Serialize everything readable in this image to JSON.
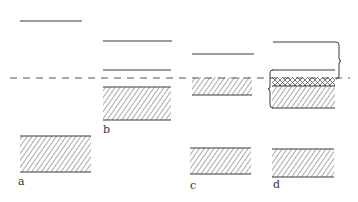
{
  "figure": {
    "stroke_color": "#3a3a3a",
    "hatch_color": "#555555",
    "reference_line": {
      "y": 78,
      "x1": 10,
      "x2": 350,
      "style": "dashed"
    },
    "panels": [
      {
        "id": "a",
        "label": "a",
        "lines": [
          {
            "y": 21,
            "x1": 20,
            "x2": 82
          }
        ],
        "blocks": [
          {
            "x": 20,
            "y": 136,
            "w": 71,
            "h": 36,
            "fill": "diagonal"
          }
        ]
      },
      {
        "id": "b",
        "label": "b",
        "lines": [
          {
            "y": 41,
            "x1": 103,
            "x2": 172
          },
          {
            "y": 70,
            "x1": 103,
            "x2": 171
          }
        ],
        "blocks": [
          {
            "x": 103,
            "y": 87,
            "w": 68,
            "h": 33,
            "fill": "diagonal"
          }
        ]
      },
      {
        "id": "c",
        "label": "c",
        "lines": [
          {
            "y": 54,
            "x1": 192,
            "x2": 254
          }
        ],
        "blocks": [
          {
            "x": 192,
            "y": 77,
            "w": 60,
            "h": 18,
            "fill": "diagonal"
          },
          {
            "x": 190,
            "y": 148,
            "w": 61,
            "h": 26,
            "fill": "diagonal"
          }
        ]
      },
      {
        "id": "d",
        "label": "d",
        "lines": [
          {
            "y": 42,
            "x1": 273,
            "x2": 338
          },
          {
            "y": 70,
            "x1": 272,
            "x2": 335
          }
        ],
        "blocks": [
          {
            "x": 272,
            "y": 77,
            "w": 63,
            "h": 9,
            "fill": "crosshatch"
          },
          {
            "x": 272,
            "y": 86,
            "w": 63,
            "h": 22,
            "fill": "diagonal"
          },
          {
            "x": 272,
            "y": 149,
            "w": 62,
            "h": 28,
            "fill": "diagonal"
          }
        ],
        "braces": [
          {
            "side": "right",
            "x": 338,
            "y1": 42,
            "y2": 78
          },
          {
            "side": "left",
            "x": 270,
            "y1": 70,
            "y2": 108
          }
        ]
      }
    ],
    "labels": {
      "a": "a",
      "b": "b",
      "c": "c",
      "d": "d"
    }
  }
}
